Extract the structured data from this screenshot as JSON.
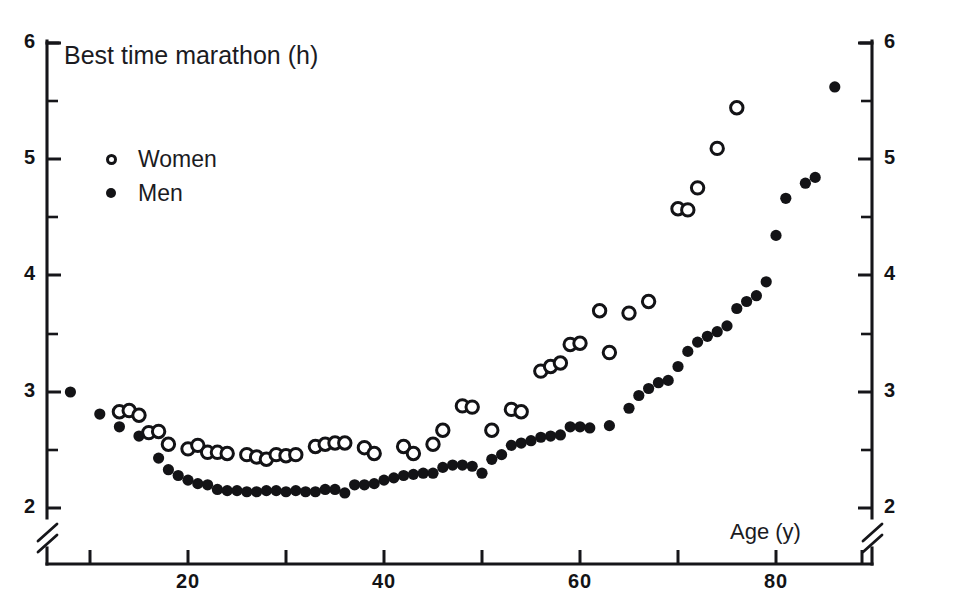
{
  "chart_data": {
    "type": "scatter",
    "title": "Best time marathon (h)",
    "xlabel": "Age (y)",
    "ylabel": "Best time marathon (h)",
    "xlim": [
      5,
      92
    ],
    "ylim": [
      1.85,
      6.0
    ],
    "grid": false,
    "y_axis_break": true,
    "y_axis_break_note": "axis broken between 0 and 2",
    "legend_position": "upper left inside",
    "x_ticks_major": [
      10,
      20,
      30,
      40,
      50,
      60,
      70,
      80,
      90
    ],
    "x_tick_labels": [
      "",
      "20",
      "",
      "40",
      "",
      "60",
      "",
      "80",
      ""
    ],
    "y_ticks_major": [
      2,
      3,
      4,
      5,
      6
    ],
    "y_tick_labels": [
      "2",
      "3",
      "4",
      "5",
      "6"
    ],
    "y_ticks_minor": [
      2.5,
      3.5,
      4.5,
      5.5
    ],
    "series": [
      {
        "name": "Women",
        "marker": "open-circle",
        "color": "#131316",
        "points": [
          [
            13,
            2.83
          ],
          [
            14,
            2.84
          ],
          [
            15,
            2.8
          ],
          [
            16,
            2.65
          ],
          [
            17,
            2.66
          ],
          [
            18,
            2.55
          ],
          [
            20,
            2.51
          ],
          [
            21,
            2.54
          ],
          [
            22,
            2.48
          ],
          [
            23,
            2.48
          ],
          [
            24,
            2.47
          ],
          [
            26,
            2.46
          ],
          [
            27,
            2.44
          ],
          [
            28,
            2.42
          ],
          [
            29,
            2.46
          ],
          [
            30,
            2.45
          ],
          [
            31,
            2.46
          ],
          [
            33,
            2.53
          ],
          [
            34,
            2.55
          ],
          [
            35,
            2.56
          ],
          [
            36,
            2.56
          ],
          [
            38,
            2.52
          ],
          [
            39,
            2.47
          ],
          [
            42,
            2.53
          ],
          [
            43,
            2.47
          ],
          [
            45,
            2.55
          ],
          [
            46,
            2.67
          ],
          [
            48,
            2.88
          ],
          [
            49,
            2.87
          ],
          [
            51,
            2.67
          ],
          [
            53,
            2.85
          ],
          [
            54,
            2.83
          ],
          [
            56,
            3.18
          ],
          [
            57,
            3.22
          ],
          [
            58,
            3.25
          ],
          [
            59,
            3.41
          ],
          [
            60,
            3.42
          ],
          [
            62,
            3.7
          ],
          [
            63,
            3.34
          ],
          [
            65,
            3.68
          ],
          [
            67,
            3.78
          ],
          [
            70,
            4.58
          ],
          [
            71,
            4.57
          ],
          [
            72,
            4.76
          ],
          [
            74,
            5.1
          ],
          [
            76,
            5.45
          ]
        ]
      },
      {
        "name": "Men",
        "marker": "filled-circle",
        "color": "#131316",
        "points": [
          [
            8,
            3.0
          ],
          [
            11,
            2.81
          ],
          [
            13,
            2.7
          ],
          [
            15,
            2.62
          ],
          [
            17,
            2.43
          ],
          [
            18,
            2.33
          ],
          [
            19,
            2.28
          ],
          [
            20,
            2.24
          ],
          [
            21,
            2.21
          ],
          [
            22,
            2.2
          ],
          [
            23,
            2.16
          ],
          [
            24,
            2.15
          ],
          [
            25,
            2.15
          ],
          [
            26,
            2.14
          ],
          [
            27,
            2.14
          ],
          [
            28,
            2.15
          ],
          [
            29,
            2.15
          ],
          [
            30,
            2.14
          ],
          [
            31,
            2.15
          ],
          [
            32,
            2.14
          ],
          [
            33,
            2.14
          ],
          [
            34,
            2.16
          ],
          [
            35,
            2.16
          ],
          [
            36,
            2.13
          ],
          [
            37,
            2.2
          ],
          [
            38,
            2.2
          ],
          [
            39,
            2.21
          ],
          [
            40,
            2.24
          ],
          [
            41,
            2.26
          ],
          [
            42,
            2.28
          ],
          [
            43,
            2.29
          ],
          [
            44,
            2.3
          ],
          [
            45,
            2.3
          ],
          [
            46,
            2.35
          ],
          [
            47,
            2.37
          ],
          [
            48,
            2.37
          ],
          [
            49,
            2.36
          ],
          [
            50,
            2.3
          ],
          [
            51,
            2.42
          ],
          [
            52,
            2.46
          ],
          [
            53,
            2.54
          ],
          [
            54,
            2.56
          ],
          [
            55,
            2.58
          ],
          [
            56,
            2.61
          ],
          [
            57,
            2.62
          ],
          [
            58,
            2.63
          ],
          [
            59,
            2.7
          ],
          [
            60,
            2.7
          ],
          [
            61,
            2.69
          ],
          [
            63,
            2.71
          ],
          [
            65,
            2.86
          ],
          [
            66,
            2.97
          ],
          [
            67,
            3.03
          ],
          [
            68,
            3.08
          ],
          [
            69,
            3.1
          ],
          [
            70,
            3.22
          ],
          [
            71,
            3.35
          ],
          [
            72,
            3.43
          ],
          [
            73,
            3.48
          ],
          [
            74,
            3.52
          ],
          [
            75,
            3.57
          ],
          [
            76,
            3.72
          ],
          [
            77,
            3.78
          ],
          [
            78,
            3.83
          ],
          [
            79,
            3.95
          ],
          [
            80,
            4.35
          ],
          [
            81,
            4.67
          ],
          [
            83,
            4.8
          ],
          [
            84,
            4.85
          ],
          [
            86,
            5.63
          ]
        ]
      }
    ]
  },
  "legend": {
    "items": [
      {
        "label": "Women",
        "marker": "open-circle"
      },
      {
        "label": "Men",
        "marker": "filled-circle"
      }
    ]
  },
  "axes": {
    "y_left_labels": [
      "6",
      "5",
      "4",
      "3",
      "2"
    ],
    "y_right_labels": [
      "6",
      "5",
      "4",
      "3",
      "2"
    ],
    "x_labels": [
      "20",
      "40",
      "60",
      "80"
    ]
  }
}
